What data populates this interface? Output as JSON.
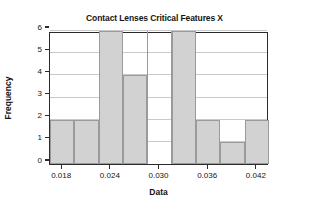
{
  "chart_data": {
    "type": "bar",
    "title": "Contact Lenses Critical Features X",
    "xlabel": "Data",
    "ylabel": "Frequency",
    "ylim": [
      0,
      6
    ],
    "xlim": [
      0.0165,
      0.0435
    ],
    "grid": true,
    "legend": null,
    "bin_width": 0.003,
    "bin_edges": [
      0.0165,
      0.0195,
      0.0225,
      0.0255,
      0.0285,
      0.0315,
      0.0345,
      0.0375,
      0.0405,
      0.0435
    ],
    "categories": [
      "0.0165-0.0195",
      "0.0195-0.0225",
      "0.0225-0.0255",
      "0.0255-0.0285",
      "0.0285-0.0315",
      "0.0315-0.0345",
      "0.0345-0.0375",
      "0.0375-0.0405",
      "0.0405-0.0435"
    ],
    "values": [
      2,
      2,
      6,
      4,
      0,
      6,
      2,
      1,
      2
    ],
    "xticks": [
      {
        "value": 0.018,
        "label": "0.018"
      },
      {
        "value": 0.024,
        "label": "0.024"
      },
      {
        "value": 0.03,
        "label": "0.030"
      },
      {
        "value": 0.036,
        "label": "0.036"
      },
      {
        "value": 0.042,
        "label": "0.042"
      }
    ],
    "yticks": [
      {
        "value": 0,
        "label": "0"
      },
      {
        "value": 1,
        "label": "1"
      },
      {
        "value": 2,
        "label": "2"
      },
      {
        "value": 3,
        "label": "3"
      },
      {
        "value": 4,
        "label": "4"
      },
      {
        "value": 5,
        "label": "5"
      },
      {
        "value": 6,
        "label": "6"
      }
    ],
    "colors": {
      "bar_fill": "#d2d2d2",
      "bar_border": "#9a9a9a",
      "gridline": "#c9c9c9",
      "axis": "#2b2b2b",
      "background": "#ffffff",
      "text": "#141414"
    }
  }
}
